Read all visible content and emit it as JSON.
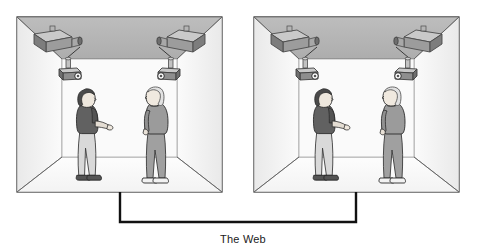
{
  "figure": {
    "title": "",
    "caption_label": "The Web",
    "rooms": [
      {
        "id": "room-left",
        "name": "telepresence-room-left",
        "x": 17,
        "y": 17,
        "width": 205,
        "height": 175,
        "ceiling_color": "#b4b4b4",
        "wall_color": "#f2f2f2",
        "back_wall_color": "#fafafa",
        "floor_color": "#ffffff",
        "outline_color": "#2b2b2b",
        "devices": [
          {
            "name": "ceiling-projector-left",
            "type": "projector",
            "position": "ceiling-left"
          },
          {
            "name": "ceiling-projector-right",
            "type": "projector",
            "position": "ceiling-right"
          },
          {
            "name": "ceiling-camera-left",
            "type": "camera",
            "position": "back-wall-left"
          },
          {
            "name": "ceiling-camera-right",
            "type": "camera",
            "position": "back-wall-right"
          }
        ],
        "people": [
          {
            "name": "person-local",
            "hair": "dark",
            "shirt": "#5f5f5f",
            "pants": "#d6d6d6",
            "shoes": "#4a4a4a",
            "facing": "right"
          },
          {
            "name": "person-remote-projection",
            "hair": "#e8e8e8",
            "shirt": "#9a9a9a",
            "pants": "#9a9a9a",
            "shoes": "#f0f0f0",
            "facing": "left"
          }
        ]
      },
      {
        "id": "room-right",
        "name": "telepresence-room-right",
        "x": 254,
        "y": 17,
        "width": 205,
        "height": 175,
        "ceiling_color": "#b4b4b4",
        "wall_color": "#f2f2f2",
        "back_wall_color": "#fafafa",
        "floor_color": "#ffffff",
        "outline_color": "#2b2b2b",
        "devices": [
          {
            "name": "ceiling-projector-left",
            "type": "projector",
            "position": "ceiling-left"
          },
          {
            "name": "ceiling-projector-right",
            "type": "projector",
            "position": "ceiling-right"
          },
          {
            "name": "ceiling-camera-left",
            "type": "camera",
            "position": "back-wall-left"
          },
          {
            "name": "ceiling-camera-right",
            "type": "camera",
            "position": "back-wall-right"
          }
        ],
        "people": [
          {
            "name": "person-local",
            "hair": "dark",
            "shirt": "#5f5f5f",
            "pants": "#d6d6d6",
            "shoes": "#4a4a4a",
            "facing": "right"
          },
          {
            "name": "person-remote-projection",
            "hair": "#e8e8e8",
            "shirt": "#9a9a9a",
            "pants": "#9a9a9a",
            "shoes": "#f0f0f0",
            "facing": "left"
          }
        ]
      }
    ],
    "network_link": {
      "name": "web-connector",
      "left_drop_x": 120,
      "right_drop_x": 356,
      "top_y": 192,
      "bottom_y": 222,
      "stroke_color": "#111111",
      "stroke_width": 2.4
    },
    "colors": {
      "line": "#2b2b2b",
      "ceiling": "#b4b4b4",
      "wall_light": "#f4f4f4",
      "wall_mid": "#ececec",
      "floor": "#ffffff",
      "device_body": "#9d9d9d",
      "device_dark": "#6d6d6d",
      "text": "#1b1b1b"
    }
  }
}
